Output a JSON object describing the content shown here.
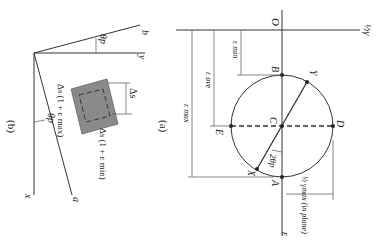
{
  "figure": {
    "panel_a": {
      "caption": "(a)",
      "axis_labels": {
        "origin": "O",
        "horizontal": "ε",
        "vertical": "½γ"
      },
      "points": [
        "A",
        "B",
        "C",
        "D",
        "E",
        "X",
        "Y"
      ],
      "dimensions": {
        "eps_min": "ε min",
        "eps_ave": "ε ave",
        "eps_max": "ε max",
        "gamma_max": "½ γmax (in plane)"
      },
      "angle_label": "2θp"
    },
    "panel_b": {
      "caption": "(b)",
      "axes": {
        "x": "x",
        "y": "y",
        "a": "a",
        "b": "b"
      },
      "angle_label": "θp",
      "element_labels": {
        "side": "Δs",
        "max_side": "Δs (1 + ε max)",
        "min_side": "Δs (1 + ε min)"
      }
    },
    "colors": {
      "element_fill": "#8a8a8a",
      "line": "#333333",
      "background": "#ffffff"
    }
  }
}
